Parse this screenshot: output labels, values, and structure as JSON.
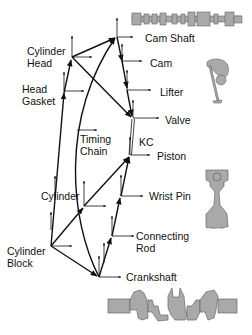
{
  "diagram": {
    "type": "kinematic-chain-assembly-graph",
    "line_color": "#111111",
    "part_fill": "#a9a9a9",
    "part_stroke": "#555555",
    "nodes": [
      {
        "id": "cylinder_head",
        "label_line1": "Cylinder",
        "label_line2": "Head"
      },
      {
        "id": "head_gasket",
        "label_line1": "Head",
        "label_line2": "Gasket"
      },
      {
        "id": "timing_chain",
        "label_line1": "Timing",
        "label_line2": "Chain"
      },
      {
        "id": "cylinder",
        "label": "Cylinder"
      },
      {
        "id": "cylinder_block",
        "label_line1": "Cylinder",
        "label_line2": "Block"
      },
      {
        "id": "cam_shaft",
        "label": "Cam Shaft"
      },
      {
        "id": "cam",
        "label": "Cam"
      },
      {
        "id": "lifter",
        "label": "Lifter"
      },
      {
        "id": "valve",
        "label": "Valve"
      },
      {
        "id": "kc",
        "label": "KC"
      },
      {
        "id": "piston",
        "label": "Piston"
      },
      {
        "id": "wrist_pin",
        "label": "Wrist Pin"
      },
      {
        "id": "connecting_rod",
        "label_line1": "Connecting",
        "label_line2": "Rod"
      },
      {
        "id": "crankshaft",
        "label": "Crankshaft"
      }
    ],
    "illustrations": [
      "camshaft",
      "cam-lifter-valve",
      "piston-connecting-rod",
      "crankshaft"
    ]
  }
}
